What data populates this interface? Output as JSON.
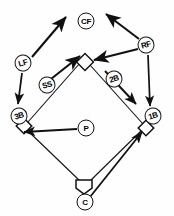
{
  "diagram": {
    "type": "field-position-diagram",
    "width": 174,
    "height": 216,
    "colors": {
      "background": "#fefefe",
      "ink": "#111111",
      "base_fill": "#ffffff"
    },
    "players": [
      {
        "id": "cf",
        "label": "CF",
        "name": "center-fielder",
        "x": 86,
        "y": 21,
        "rotated": false
      },
      {
        "id": "lf",
        "label": "LF",
        "name": "left-fielder",
        "x": 23,
        "y": 63,
        "rotated": true
      },
      {
        "id": "rf",
        "label": "RF",
        "name": "right-fielder",
        "x": 146,
        "y": 45,
        "rotated": true
      },
      {
        "id": "ss",
        "label": "SS",
        "name": "shortstop",
        "x": 47,
        "y": 85,
        "rotated": true
      },
      {
        "id": "2b",
        "label": "2B",
        "name": "second-baseman",
        "x": 114,
        "y": 79,
        "rotated": true
      },
      {
        "id": "3b",
        "label": "3B",
        "name": "third-baseman",
        "x": 19,
        "y": 116,
        "rotated": true
      },
      {
        "id": "1b",
        "label": "1B",
        "name": "first-baseman",
        "x": 153,
        "y": 116,
        "rotated": true
      },
      {
        "id": "p",
        "label": "P",
        "name": "pitcher",
        "x": 86,
        "y": 128,
        "rotated": false
      },
      {
        "id": "c",
        "label": "C",
        "name": "catcher",
        "x": 85,
        "y": 202,
        "rotated": false
      }
    ],
    "bases": [
      {
        "id": "second-base",
        "name": "second-base-marker",
        "x": 85,
        "y": 62
      },
      {
        "id": "third-base",
        "name": "third-base-marker",
        "x": 24,
        "y": 126
      },
      {
        "id": "first-base",
        "name": "first-base-marker",
        "x": 146,
        "y": 128
      },
      {
        "id": "home-plate",
        "name": "home-plate-marker",
        "x": 84,
        "y": 186
      }
    ],
    "baselines": [
      {
        "id": "home-to-third",
        "from": "home-plate",
        "to": "third-base"
      },
      {
        "id": "third-to-second",
        "from": "third-base",
        "to": "second-base"
      },
      {
        "id": "second-to-first",
        "from": "second-base",
        "to": "first-base"
      },
      {
        "id": "first-to-home",
        "from": "first-base",
        "to": "home-plate"
      }
    ],
    "movement_arrows": [
      {
        "id": "lf-deep",
        "name": "arrow-lf-to-deep-left-center",
        "from": "LF",
        "to": "deep left-center field"
      },
      {
        "id": "lf-to-third",
        "name": "arrow-lf-to-third-base",
        "from": "LF",
        "to": "3B"
      },
      {
        "id": "ss-to-second",
        "name": "arrow-ss-to-second-base",
        "from": "SS",
        "to": "2nd base"
      },
      {
        "id": "rf-deep",
        "name": "arrow-rf-to-deep-right-center",
        "from": "RF",
        "to": "deep right-center field"
      },
      {
        "id": "rf-to-second",
        "name": "arrow-rf-to-second-base",
        "from": "RF",
        "to": "2nd base"
      },
      {
        "id": "rf-to-first",
        "name": "arrow-rf-to-first-base",
        "from": "RF",
        "to": "1B"
      },
      {
        "id": "2b-to-first",
        "name": "arrow-2b-to-first-base",
        "from": "2B",
        "to": "1B"
      },
      {
        "id": "p-to-third",
        "name": "arrow-p-to-third-base",
        "from": "P",
        "to": "3B"
      },
      {
        "id": "c-to-first",
        "name": "arrow-c-to-first-base",
        "from": "C",
        "to": "1B"
      }
    ]
  }
}
